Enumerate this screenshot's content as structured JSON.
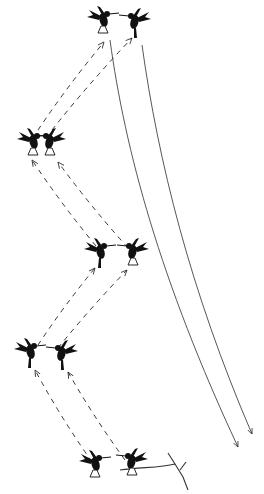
{
  "diagram": {
    "title": "",
    "background": "#ffffff",
    "ink": "#111111",
    "birds": [
      {
        "id": "top-left",
        "x": 103,
        "y": 18,
        "facing": "right",
        "legs": "tucked-open"
      },
      {
        "id": "top-right",
        "x": 135,
        "y": 20,
        "facing": "left",
        "legs": "dangling"
      },
      {
        "id": "level2-left",
        "x": 33,
        "y": 140,
        "facing": "right",
        "legs": "open"
      },
      {
        "id": "level2-right",
        "x": 50,
        "y": 140,
        "facing": "left",
        "legs": "open"
      },
      {
        "id": "level3-left",
        "x": 100,
        "y": 250,
        "facing": "right",
        "legs": "dangling"
      },
      {
        "id": "level3-right",
        "x": 133,
        "y": 250,
        "facing": "left",
        "legs": "open"
      },
      {
        "id": "level4-left",
        "x": 30,
        "y": 350,
        "facing": "right",
        "legs": "dangling"
      },
      {
        "id": "level4-right",
        "x": 62,
        "y": 352,
        "facing": "left",
        "legs": "dangling"
      },
      {
        "id": "bottom-left",
        "x": 95,
        "y": 462,
        "facing": "right",
        "legs": "open"
      },
      {
        "id": "bottom-right-perched",
        "x": 132,
        "y": 460,
        "facing": "left",
        "legs": "perched"
      }
    ],
    "dashed_arrows": [
      {
        "from": [
          92,
          462
        ],
        "to": [
          35,
          370
        ]
      },
      {
        "from": [
          125,
          460
        ],
        "to": [
          68,
          372
        ]
      },
      {
        "from": [
          38,
          345
        ],
        "to": [
          95,
          268
        ]
      },
      {
        "from": [
          58,
          348
        ],
        "to": [
          127,
          270
        ]
      },
      {
        "from": [
          96,
          246
        ],
        "to": [
          32,
          160
        ]
      },
      {
        "from": [
          128,
          248
        ],
        "to": [
          58,
          162
        ]
      },
      {
        "from": [
          38,
          130
        ],
        "to": [
          104,
          42
        ]
      },
      {
        "from": [
          52,
          130
        ],
        "to": [
          132,
          38
        ]
      }
    ],
    "solid_arrows": [
      {
        "path": "M110 40 C 125 150, 160 280, 238 447"
      },
      {
        "path": "M142 45 C 158 160, 190 290, 252 434"
      }
    ],
    "branch": {
      "path": "M120 470 C 140 467, 160 468, 175 464 M175 464 L168 453 M175 464 L183 477 L188 490 M180 470 L186 462"
    }
  }
}
